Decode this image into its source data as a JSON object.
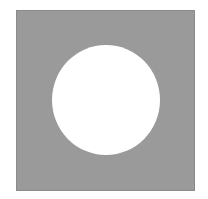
{
  "figure": {
    "shape": "square-with-circular-hole",
    "square_color": "#9a9a9a",
    "circle_color": "#ffffff",
    "background_color": "#ffffff"
  }
}
